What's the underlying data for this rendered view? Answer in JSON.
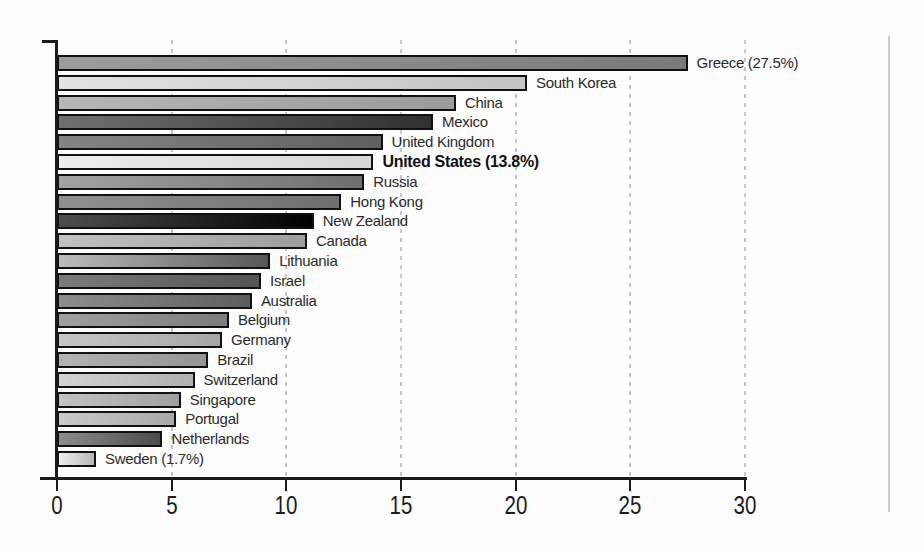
{
  "page": {
    "background": "#fdfdfd",
    "page_edge_color": "#cccccc"
  },
  "chart_data": {
    "type": "bar",
    "orientation": "horizontal",
    "title": "",
    "xlabel": "",
    "ylabel": "",
    "xlim": [
      0,
      30
    ],
    "x_ticks": [
      0,
      5,
      10,
      15,
      20,
      25,
      30
    ],
    "grid": "dashed vertical gridlines at each x tick",
    "grid_color": "#c6c6c6",
    "axis_color": "#1a1a1a",
    "legend": "none",
    "categories": [
      "Greece",
      "South Korea",
      "China",
      "Mexico",
      "United Kingdom",
      "United States",
      "Russia",
      "Hong Kong",
      "New Zealand",
      "Canada",
      "Lithuania",
      "Israel",
      "Australia",
      "Belgium",
      "Germany",
      "Brazil",
      "Switzerland",
      "Singapore",
      "Portugal",
      "Netherlands",
      "Sweden"
    ],
    "values": [
      27.5,
      20.5,
      17.4,
      16.4,
      14.2,
      13.8,
      13.4,
      12.4,
      11.2,
      10.9,
      9.3,
      8.9,
      8.5,
      7.5,
      7.2,
      6.6,
      6.0,
      5.4,
      5.2,
      4.6,
      1.7
    ],
    "bars": [
      {
        "label": "Greece (27.5%)",
        "value": 27.5,
        "bold": false,
        "color_from": "#9c9c9c",
        "color_to": "#7a7a7a"
      },
      {
        "label": "South Korea",
        "value": 20.5,
        "bold": false,
        "color_from": "#e3e3e3",
        "color_to": "#c3c3c3"
      },
      {
        "label": "China",
        "value": 17.4,
        "bold": false,
        "color_from": "#b6b6b6",
        "color_to": "#9b9b9b"
      },
      {
        "label": "Mexico",
        "value": 16.4,
        "bold": false,
        "color_from": "#6f6f6f",
        "color_to": "#303030"
      },
      {
        "label": "United Kingdom",
        "value": 14.2,
        "bold": false,
        "color_from": "#848484",
        "color_to": "#606060"
      },
      {
        "label": "United States (13.8%)",
        "value": 13.8,
        "bold": true,
        "color_from": "#ededed",
        "color_to": "#d7d7d7"
      },
      {
        "label": "Russia",
        "value": 13.4,
        "bold": false,
        "color_from": "#a2a2a2",
        "color_to": "#6f6f6f"
      },
      {
        "label": "Hong Kong",
        "value": 12.4,
        "bold": false,
        "color_from": "#909090",
        "color_to": "#6f6f6f"
      },
      {
        "label": "New Zealand",
        "value": 11.2,
        "bold": false,
        "color_from": "#4d4d4d",
        "color_to": "#000000"
      },
      {
        "label": "Canada",
        "value": 10.9,
        "bold": false,
        "color_from": "#c2c2c2",
        "color_to": "#9d9d9d"
      },
      {
        "label": "Lithuania",
        "value": 9.3,
        "bold": false,
        "color_from": "#bdbdbd",
        "color_to": "#575757"
      },
      {
        "label": "Israel",
        "value": 8.9,
        "bold": false,
        "color_from": "#7b7b7b",
        "color_to": "#555555"
      },
      {
        "label": "Australia",
        "value": 8.5,
        "bold": false,
        "color_from": "#8d8d8d",
        "color_to": "#5e5e5e"
      },
      {
        "label": "Belgium",
        "value": 7.5,
        "bold": false,
        "color_from": "#a0a0a0",
        "color_to": "#7c7c7c"
      },
      {
        "label": "Germany",
        "value": 7.2,
        "bold": false,
        "color_from": "#c6c6c6",
        "color_to": "#a6a6a6"
      },
      {
        "label": "Brazil",
        "value": 6.6,
        "bold": false,
        "color_from": "#b4b4b4",
        "color_to": "#949494"
      },
      {
        "label": "Switzerland",
        "value": 6.0,
        "bold": false,
        "color_from": "#d4d4d4",
        "color_to": "#b0b0b0"
      },
      {
        "label": "Singapore",
        "value": 5.4,
        "bold": false,
        "color_from": "#c2c2c2",
        "color_to": "#a0a0a0"
      },
      {
        "label": "Portugal",
        "value": 5.2,
        "bold": false,
        "color_from": "#cacaca",
        "color_to": "#a8a8a8"
      },
      {
        "label": "Netherlands",
        "value": 4.6,
        "bold": false,
        "color_from": "#8c8c8c",
        "color_to": "#4c4c4c"
      },
      {
        "label": "Sweden (1.7%)",
        "value": 1.7,
        "bold": false,
        "color_from": "#efefef",
        "color_to": "#b6b6b6"
      }
    ]
  }
}
